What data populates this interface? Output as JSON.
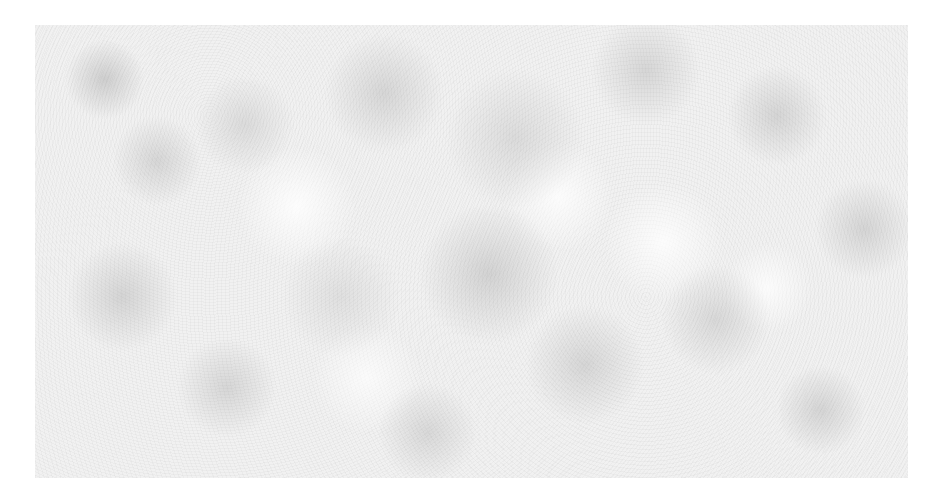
{
  "image": {
    "description": "Grayscale mottled noise texture on white background",
    "background_color": "#ffffff",
    "texture_color": "#f1f1f1",
    "texture_bounds": {
      "left": 35,
      "top": 25,
      "right": 908,
      "bottom": 478
    }
  }
}
